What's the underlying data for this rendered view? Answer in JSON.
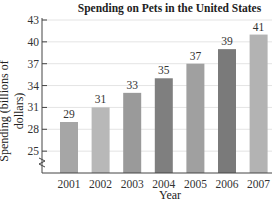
{
  "chart_data": {
    "type": "bar",
    "title": "Spending on Pets in the United States",
    "xlabel": "Year",
    "ylabel": "Spending (billions of dollars)",
    "categories": [
      "2001",
      "2002",
      "2003",
      "2004",
      "2005",
      "2006",
      "2007"
    ],
    "values": [
      29,
      31,
      33,
      35,
      37,
      39,
      41
    ],
    "bar_colors": [
      "#a6a6a6",
      "#b8b8b8",
      "#9a9a9a",
      "#7f7f7f",
      "#a0a0a0",
      "#7a7a7a",
      "#b3b3b3"
    ],
    "yticks": [
      25,
      28,
      31,
      34,
      37,
      40,
      43
    ],
    "ylim": [
      22,
      43
    ],
    "axis_break": true,
    "grid": true,
    "data_labels": true
  }
}
